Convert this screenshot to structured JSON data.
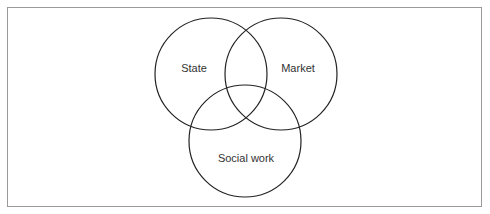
{
  "diagram": {
    "type": "venn",
    "sets": [
      {
        "id": "state",
        "label": "State",
        "cx": 211,
        "cy": 74,
        "r": 56
      },
      {
        "id": "market",
        "label": "Market",
        "cx": 281,
        "cy": 74,
        "r": 56
      },
      {
        "id": "social-work",
        "label": "Social work",
        "cx": 245,
        "cy": 141,
        "r": 56
      }
    ],
    "stroke_color": "#222222"
  }
}
